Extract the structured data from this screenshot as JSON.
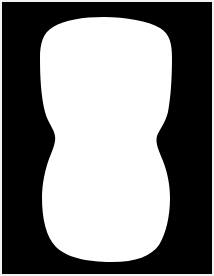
{
  "image": {
    "kind": "binary-segmentation-mask",
    "width": 214,
    "height": 276,
    "background_color": "#000000",
    "foreground_color": "#ffffff",
    "border_color": "#f2f2f2",
    "border_width_px": 2,
    "alt_text": "White hourglass-shaped blob silhouette on a black background"
  },
  "mask": {
    "region_label": "foreground-blob",
    "fill": "#ffffff",
    "bounds": {
      "left": 40,
      "top": 17,
      "right": 172,
      "bottom": 262
    },
    "waist": {
      "y": 135,
      "left": 52,
      "right": 157
    },
    "top_lobe": {
      "widest_y": 90,
      "left": 40,
      "right": 172
    },
    "bottom_lobe": {
      "widest_y": 196,
      "left": 42,
      "right": 170
    },
    "path": "M 104 17 C 126 17 148 21 160 28 C 170 34 172 44 172 58 C 172 76 171 96 168 112 C 165 124 159 130 157 136 C 155 143 159 151 163 161 C 168 174 170 186 170 198 C 170 216 166 234 159 245 C 151 256 136 262 112 262 C 86 262 66 257 56 247 C 46 237 42 218 42 198 C 42 184 45 170 49 159 C 53 149 56 142 55 136 C 54 129 48 123 45 112 C 41 97 40 76 40 58 C 40 43 43 33 53 27 C 65 20 82 17 104 17 Z"
  }
}
